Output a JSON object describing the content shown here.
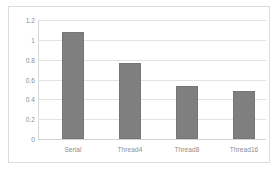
{
  "chart_data": {
    "type": "bar",
    "title": "",
    "subtitle": "",
    "xlabel": "",
    "ylabel": "",
    "categories": [
      "Serial",
      "Thread4",
      "Thread8",
      "Thread16"
    ],
    "values": [
      1.08,
      0.77,
      0.53,
      0.48
    ],
    "series": [
      {
        "name": "",
        "values": [
          1.08,
          0.77,
          0.53,
          0.48
        ]
      }
    ],
    "ylim": [
      0,
      1.2
    ],
    "ytick_labels": [
      "1.2",
      "1",
      "0.8",
      "0.6",
      "0.4",
      "0.2",
      "0"
    ],
    "ytick_values": [
      1.2,
      1,
      0.8,
      0.6,
      0.4,
      0.2,
      0
    ],
    "grid": true,
    "grid_axis": "y",
    "legend": false,
    "legend_position": "none",
    "annotations": [],
    "colors": {
      "bar": "#7f7f7f",
      "bar_border": "#767676",
      "gridline": "#e2e2e2",
      "axis": "#d9d9d9",
      "tick_label": "#8c8c8c",
      "frame_border": "#dcdcdc",
      "background": "#ffffff"
    }
  }
}
